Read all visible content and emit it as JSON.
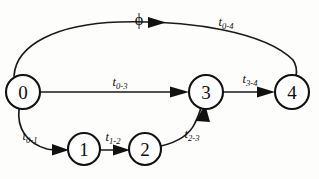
{
  "diagram": {
    "type": "directed-graph",
    "title": "",
    "background_color": "#fdfdfc",
    "stroke_color": "#111111",
    "nodes": [
      {
        "id": "0",
        "label": "0",
        "cx": 23,
        "cy": 92,
        "r": 17
      },
      {
        "id": "1",
        "label": "1",
        "cx": 84,
        "cy": 149,
        "r": 16
      },
      {
        "id": "2",
        "label": "2",
        "cx": 145,
        "cy": 149,
        "r": 16
      },
      {
        "id": "3",
        "label": "3",
        "cx": 206,
        "cy": 92,
        "r": 17
      },
      {
        "id": "4",
        "label": "4",
        "cx": 292,
        "cy": 92,
        "r": 17
      }
    ],
    "edges": [
      {
        "id": "edge-0-4",
        "from": "0",
        "to": "4",
        "shape": "arc-top",
        "label_base": "t",
        "label_sub": "0-4",
        "label_x": 226,
        "label_y": 22
      },
      {
        "id": "edge-0-3",
        "from": "0",
        "to": "3",
        "shape": "straight",
        "label_base": "t",
        "label_sub": "0-3",
        "label_x": 120,
        "label_y": 82
      },
      {
        "id": "edge-3-4",
        "from": "3",
        "to": "4",
        "shape": "straight",
        "label_base": "t",
        "label_sub": "3-4",
        "label_x": 250,
        "label_y": 79
      },
      {
        "id": "edge-0-1",
        "from": "0",
        "to": "1",
        "shape": "curve-down",
        "label_base": "t",
        "label_sub": "0-1",
        "label_x": 30,
        "label_y": 136
      },
      {
        "id": "edge-1-2",
        "from": "1",
        "to": "2",
        "shape": "straight",
        "label_base": "t",
        "label_sub": "1-2",
        "label_x": 113,
        "label_y": 137
      },
      {
        "id": "edge-2-3",
        "from": "2",
        "to": "3",
        "shape": "curve-up",
        "label_base": "t",
        "label_sub": "2-3",
        "label_x": 192,
        "label_y": 134
      }
    ],
    "annotations": [
      {
        "id": "phi-annotation",
        "symbol": "ϕ",
        "x": 139,
        "y": 19,
        "on_edge": "edge-0-4"
      }
    ]
  }
}
